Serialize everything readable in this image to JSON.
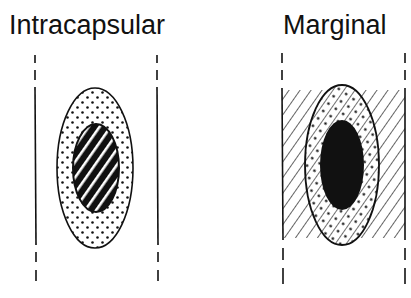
{
  "panels": [
    {
      "title": "Intracapsular",
      "lesion_pattern": "diagonal-stripes",
      "capsule_pattern": "dots",
      "margin_region": "none"
    },
    {
      "title": "Marginal",
      "lesion_pattern": "solid",
      "capsule_pattern": "dots-with-hatching",
      "margin_region": "hatched"
    }
  ],
  "colors": {
    "ink": "#111111",
    "background": "#ffffff"
  }
}
